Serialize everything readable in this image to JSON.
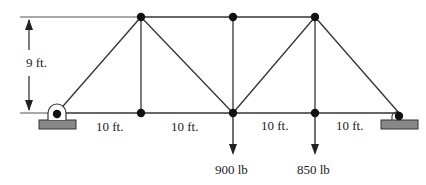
{
  "diagram": {
    "type": "truss",
    "dimensions": {
      "height_label": "9 ft.",
      "panel_labels": [
        "10 ft.",
        "10 ft.",
        "10 ft.",
        "10 ft."
      ]
    },
    "loads": [
      {
        "label": "900 lb",
        "node": "bottom-center"
      },
      {
        "label": "850 lb",
        "node": "bottom-right-interior"
      }
    ],
    "supports": {
      "left": "pin",
      "right": "roller"
    },
    "colors": {
      "member": "#333333",
      "joint": "#111111",
      "support_base": "#888888",
      "dimension_line": "#555555"
    }
  }
}
